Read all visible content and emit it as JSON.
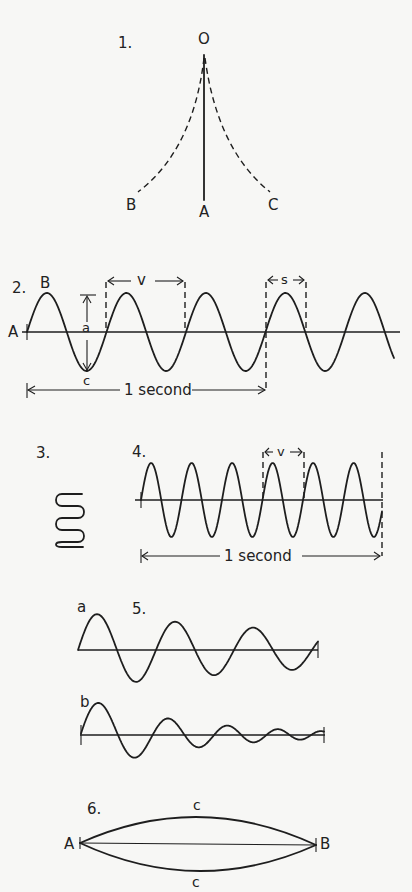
{
  "figures": [
    {
      "number": "1.",
      "kind": "pendulum",
      "labels": {
        "pivot": "O",
        "rest": "A",
        "left": "B",
        "right": "C"
      }
    },
    {
      "number": "2.",
      "kind": "wave",
      "labels": {
        "origin": "A",
        "crest": "B",
        "trough": "c",
        "amplitude": "a",
        "wavelength": "v",
        "segment": "s",
        "duration": "1 second"
      }
    },
    {
      "number": "3.",
      "kind": "coil"
    },
    {
      "number": "4.",
      "kind": "wave-high-frequency",
      "labels": {
        "wavelength": "v",
        "duration": "1 second"
      }
    },
    {
      "number": "5.",
      "kind": "damped-waves",
      "labels": {
        "slow_decay": "a",
        "fast_decay": "b"
      }
    },
    {
      "number": "6.",
      "kind": "vibrating-string",
      "labels": {
        "left_end": "A",
        "right_end": "B",
        "top": "c",
        "bottom": "c"
      }
    }
  ],
  "colors": {
    "ink": "#1e1e1e",
    "paper": "#f7f7f5"
  }
}
